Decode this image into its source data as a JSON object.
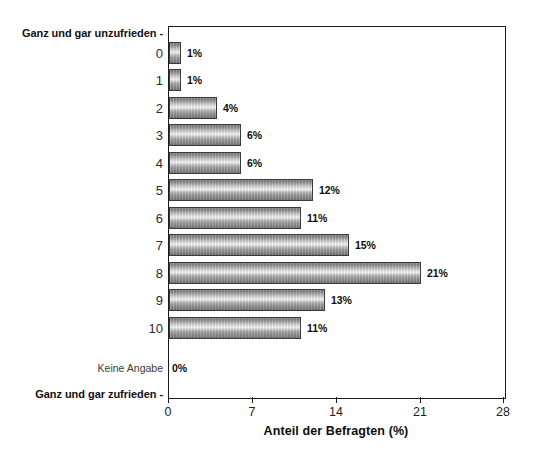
{
  "chart_data": {
    "type": "bar",
    "orientation": "horizontal",
    "title": "",
    "subtitle": "",
    "xlabel": "Anteil der Befragten (%)",
    "ylabel": "",
    "xlim": [
      0,
      28
    ],
    "xticks": [
      0,
      7,
      14,
      21,
      28
    ],
    "xticklabels": [
      "0",
      "7",
      "14",
      "21",
      "28"
    ],
    "grid": false,
    "legend": null,
    "unit": "%",
    "scale_top_label": "Ganz und gar unzufrieden -",
    "scale_bottom_label": "Ganz und gar zufrieden -",
    "categories": [
      "0",
      "1",
      "2",
      "3",
      "4",
      "5",
      "6",
      "7",
      "8",
      "9",
      "10",
      "Keine Angabe"
    ],
    "values": [
      1,
      1,
      4,
      6,
      6,
      12,
      11,
      15,
      21,
      13,
      11,
      0
    ],
    "value_labels": [
      "1%",
      "1%",
      "4%",
      "6%",
      "6%",
      "12%",
      "11%",
      "15%",
      "21%",
      "13%",
      "11%",
      "0%"
    ],
    "colors": {
      "bar_fill_light": "#f2f2f2",
      "bar_fill_mid": "#b4b4b4",
      "bar_fill_dark": "#6f6f6f",
      "bar_edge": "#3a3a3a",
      "axis": "#1a1a1a",
      "text": "#111111",
      "background": "#ffffff"
    }
  }
}
